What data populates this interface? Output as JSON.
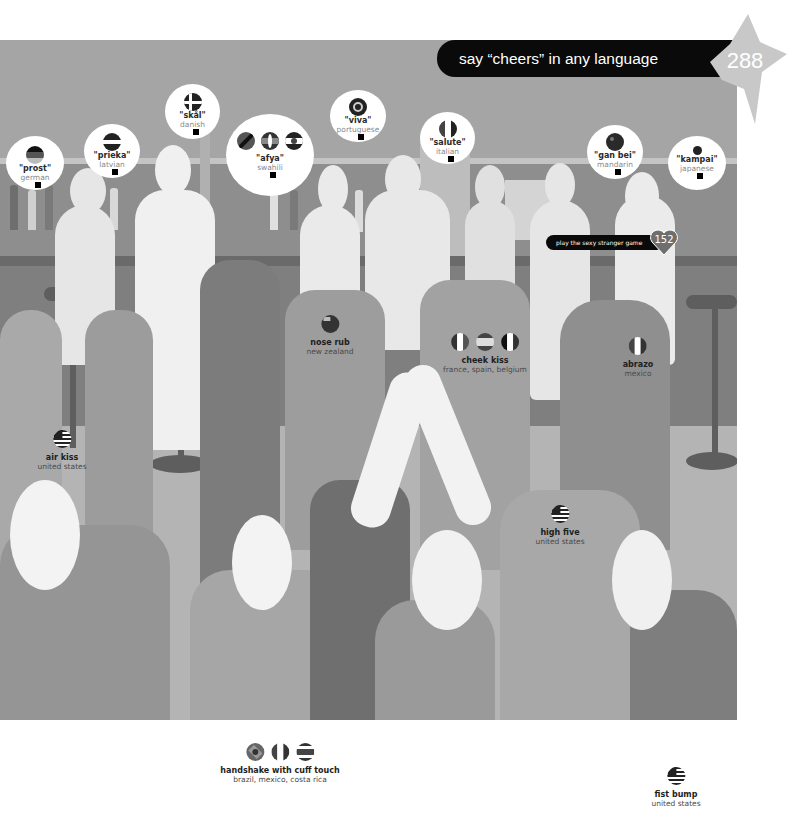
{
  "header": {
    "title": "say “cheers” in any language",
    "page_number": "288"
  },
  "cross_reference": {
    "label": "play the sexy stranger game",
    "page_number": "152"
  },
  "colors": {
    "banner_bg": "#0a0a0a",
    "badge_fill": "#c8c8c8",
    "heart_fill": "#6e6e6e",
    "scene_dark": "#7a7a7a",
    "scene_mid": "#a0a0a0",
    "scene_light": "#d2d2d2",
    "scene_white": "#f0f0f0"
  },
  "toasts": [
    {
      "phrase": "\"prost\"",
      "language": "german",
      "flags": [
        "germany"
      ]
    },
    {
      "phrase": "\"prieka\"",
      "language": "latvian",
      "flags": [
        "latvia"
      ]
    },
    {
      "phrase": "\"skål\"",
      "language": "danish",
      "flags": [
        "denmark"
      ]
    },
    {
      "phrase": "\"afya\"",
      "language": "swahili",
      "flags": [
        "tanzania",
        "kenya",
        "uganda"
      ]
    },
    {
      "phrase": "\"viva\"",
      "language": "portuguese",
      "flags": [
        "portugal"
      ]
    },
    {
      "phrase": "\"salute\"",
      "language": "italian",
      "flags": [
        "italy"
      ]
    },
    {
      "phrase": "\"gan bei\"",
      "language": "mandarin",
      "flags": [
        "china"
      ]
    },
    {
      "phrase": "\"kampai\"",
      "language": "japanese",
      "flags": [
        "japan"
      ]
    }
  ],
  "greetings": [
    {
      "title": "nose rub",
      "countries": "new zealand",
      "flags": [
        "new-zealand"
      ]
    },
    {
      "title": "cheek kiss",
      "countries": "france, spain, belgium",
      "flags": [
        "france",
        "spain",
        "belgium"
      ]
    },
    {
      "title": "abrazo",
      "countries": "mexico",
      "flags": [
        "mexico"
      ]
    },
    {
      "title": "air kiss",
      "countries": "united states",
      "flags": [
        "united-states"
      ]
    },
    {
      "title": "high five",
      "countries": "united states",
      "flags": [
        "united-states"
      ]
    },
    {
      "title": "handshake with cuff touch",
      "countries": "brazil, mexico, costa rica",
      "flags": [
        "brazil",
        "mexico",
        "costa-rica"
      ]
    },
    {
      "title": "fist bump",
      "countries": "united states",
      "flags": [
        "united-states"
      ]
    }
  ]
}
